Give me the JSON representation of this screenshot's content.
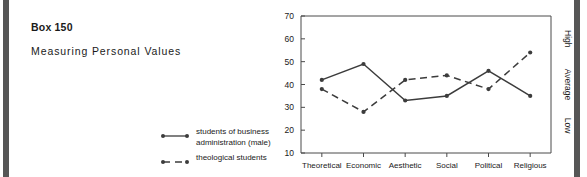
{
  "box": {
    "title": "Box 150",
    "subtitle": "Measuring Personal Values"
  },
  "legend": {
    "items": [
      {
        "label_line1": "students of business",
        "label_line2": "administration (male)",
        "style": "solid",
        "marker": "round-dot"
      },
      {
        "label_line1": "theological students",
        "label_line2": "",
        "style": "dashed",
        "marker": "round-dot"
      }
    ]
  },
  "chart_data": {
    "type": "line",
    "title": "",
    "xlabel": "",
    "ylabel": "",
    "categories": [
      "Theoretical",
      "Economic",
      "Aesthetic",
      "Social",
      "Political",
      "Religious"
    ],
    "series": [
      {
        "name": "students of business administration (male)",
        "style": "solid",
        "values": [
          42,
          49,
          33,
          35,
          46,
          35
        ]
      },
      {
        "name": "theological students",
        "style": "dashed",
        "values": [
          38,
          28,
          42,
          44,
          38,
          54
        ]
      }
    ],
    "ylim": [
      10,
      70
    ],
    "yticks": [
      10,
      20,
      30,
      40,
      50,
      60,
      70
    ],
    "ytick_labels": [
      "10",
      "20",
      "30",
      "40",
      "50",
      "60",
      "70"
    ],
    "right_axis_labels": [
      "High",
      "Average",
      "Low"
    ],
    "right_axis_values": [
      60,
      40,
      22
    ],
    "grid": false,
    "legend_position": "outside-left-bottom",
    "line_color": "#3c3c3c"
  },
  "colors": {
    "ink": "#1a1a1a",
    "line": "#3c3c3c",
    "axis": "#4a4a4a",
    "edge_bar": "#565656",
    "background": "#ffffff"
  }
}
